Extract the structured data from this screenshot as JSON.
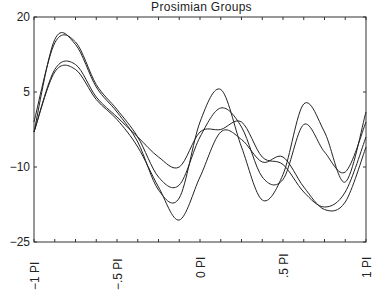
{
  "chart_data": {
    "type": "line",
    "title": "Prosimian Groups",
    "xlabel": "",
    "ylabel": "",
    "x_tick_labels": [
      "-1 PI",
      "-.5 PI",
      "0 PI",
      ".5 PI",
      "1 PI"
    ],
    "y_tick_labels": [
      "20",
      "5",
      "-10",
      "-25"
    ],
    "ylim": [
      -25,
      20
    ],
    "xlim": [
      -1,
      1
    ],
    "grid": false,
    "legend": "none",
    "x": [
      -1,
      -0.875,
      -0.75,
      -0.625,
      -0.5,
      -0.375,
      -0.25,
      -0.125,
      0,
      0.125,
      0.25,
      0.375,
      0.5,
      0.625,
      0.75,
      0.875,
      1
    ],
    "series": [
      {
        "name": "Group 1",
        "values": [
          -3,
          15.5,
          14.5,
          6,
          1,
          -5,
          -14.6,
          -16.2,
          -1,
          5.5,
          -6,
          -16.6,
          -11.5,
          2.6,
          -3,
          -13,
          1
        ]
      },
      {
        "name": "Group 2",
        "values": [
          -1,
          14.8,
          15,
          6.5,
          1.5,
          -4,
          -12,
          -13.6,
          -4,
          1.8,
          -2,
          -12,
          -12.5,
          -1.5,
          -7,
          -11,
          -1
        ]
      },
      {
        "name": "Group 3",
        "values": [
          -3,
          9.5,
          10.5,
          4,
          0,
          -4,
          -8,
          -10,
          -3,
          -2.5,
          -1,
          -8,
          -9.5,
          -15,
          -18,
          -15,
          -4
        ]
      },
      {
        "name": "Group 4",
        "values": [
          -3,
          9,
          9.5,
          3.5,
          -0.5,
          -6,
          -14,
          -20.6,
          -12,
          -3,
          -4.5,
          -9,
          -8,
          -14,
          -18.5,
          -17,
          -6
        ]
      }
    ]
  },
  "title": "Prosimian Groups",
  "axes": {
    "y_ticks": [
      "20",
      "5",
      "−10",
      "−25"
    ],
    "x_ticks": [
      "−1 PI",
      "−.5 PI",
      "0 PI",
      ".5 PI",
      "1 PI"
    ]
  }
}
